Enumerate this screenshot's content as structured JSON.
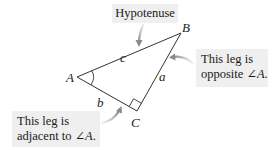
{
  "callouts": {
    "hypotenuse": {
      "text": "Hypotenuse"
    },
    "opposite": {
      "line1": "This leg is",
      "line2_prefix": "opposite ",
      "angle_symbol": "∠",
      "angle_var": "A",
      "line2_suffix": "."
    },
    "adjacent": {
      "line1": "This leg is",
      "line2_prefix": "adjacent to ",
      "angle_symbol": "∠",
      "angle_var": "A",
      "line2_suffix": "."
    }
  },
  "triangle": {
    "vertices": {
      "A": {
        "label": "A",
        "x": 77,
        "y": 77
      },
      "B": {
        "label": "B",
        "x": 181,
        "y": 33
      },
      "C": {
        "label": "C",
        "x": 137,
        "y": 111
      }
    },
    "sides": {
      "a": {
        "label": "a",
        "description": "leg opposite angle A"
      },
      "b": {
        "label": "b",
        "description": "leg adjacent to angle A"
      },
      "c": {
        "label": "c",
        "description": "hypotenuse"
      }
    },
    "right_angle_at": "C",
    "angle_marked": "A"
  },
  "colors": {
    "callout_bg": "#efefef",
    "line": "#333333",
    "arrow": "#8a8a8a",
    "text": "#1a1a1a"
  }
}
